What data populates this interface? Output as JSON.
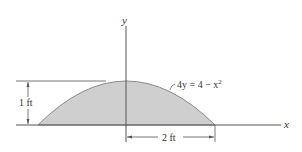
{
  "diagram": {
    "axes": {
      "x_label": "x",
      "y_label": "y"
    },
    "curve": {
      "equation_lhs": "4y = 4 − x",
      "equation_exp": "2",
      "fill_color": "#cfcfcf",
      "stroke_color": "#8a8a8a"
    },
    "dimensions": {
      "height_label": "1 ft",
      "half_width_label": "2 ft"
    }
  }
}
